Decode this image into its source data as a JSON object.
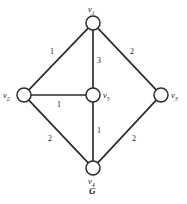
{
  "figure": {
    "caption": "G",
    "caption_x": 89,
    "caption_y": 187
  },
  "chart_data": {
    "type": "diagram",
    "title": "G",
    "subtype": "weighted-undirected-graph",
    "nodes": [
      {
        "id": "v1",
        "label": "v",
        "sub": "1",
        "x": 93,
        "y": 23,
        "r": 7,
        "label_x": 88,
        "label_y": 5
      },
      {
        "id": "v2",
        "label": "v",
        "sub": "2",
        "x": 24,
        "y": 95,
        "r": 7,
        "label_x": 3,
        "label_y": 91
      },
      {
        "id": "v3",
        "label": "v",
        "sub": "3",
        "x": 161,
        "y": 95,
        "r": 7,
        "label_x": 171,
        "label_y": 91
      },
      {
        "id": "v4",
        "label": "v",
        "sub": "4",
        "x": 93,
        "y": 168,
        "r": 7,
        "label_x": 88,
        "label_y": 177
      },
      {
        "id": "v5",
        "label": "v",
        "sub": "5",
        "x": 93,
        "y": 95,
        "r": 7,
        "label_x": 103,
        "label_y": 91
      }
    ],
    "edges": [
      {
        "source": "v1",
        "target": "v2",
        "weight": 1,
        "label_x": 50,
        "label_y": 48
      },
      {
        "source": "v1",
        "target": "v3",
        "weight": 2,
        "label_x": 130,
        "label_y": 48
      },
      {
        "source": "v1",
        "target": "v5",
        "weight": 3,
        "label_x": 97,
        "label_y": 57
      },
      {
        "source": "v2",
        "target": "v5",
        "weight": 1,
        "label_x": 57,
        "label_y": 101
      },
      {
        "source": "v2",
        "target": "v4",
        "weight": 2,
        "label_x": 48,
        "label_y": 135
      },
      {
        "source": "v5",
        "target": "v4",
        "weight": 1,
        "label_x": 97,
        "label_y": 127
      },
      {
        "source": "v4",
        "target": "v3",
        "weight": 2,
        "label_x": 132,
        "label_y": 135
      }
    ],
    "colors": {
      "stroke": "#2b2b2b",
      "node_fill": "#ffffff",
      "background": "#ffffff",
      "text": "#1a1a1a"
    }
  }
}
